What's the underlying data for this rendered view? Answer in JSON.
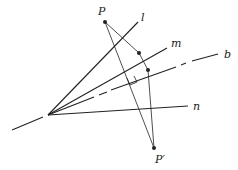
{
  "diagram": {
    "vertex": {
      "x": 48,
      "y": 115
    },
    "lines": [
      {
        "name": "l",
        "label": "l",
        "end": {
          "x": 138,
          "y": 22
        },
        "label_pos": {
          "x": 141,
          "y": 21
        },
        "style": "solid"
      },
      {
        "name": "m",
        "label": "m",
        "end": {
          "x": 167,
          "y": 48
        },
        "label_pos": {
          "x": 171,
          "y": 47
        },
        "style": "solid"
      },
      {
        "name": "b",
        "label": "b",
        "end": {
          "x": 218,
          "y": 54
        },
        "label_pos": {
          "x": 224,
          "y": 58
        },
        "style": "dashed"
      },
      {
        "name": "n",
        "label": "n",
        "end": {
          "x": 188,
          "y": 106
        },
        "label_pos": {
          "x": 193,
          "y": 110
        },
        "style": "solid"
      }
    ],
    "points": [
      {
        "name": "P",
        "label": "P",
        "pos": {
          "x": 105,
          "y": 22
        },
        "label_pos": {
          "x": 98,
          "y": 15
        }
      },
      {
        "name": "P-prime",
        "label": "P′",
        "pos": {
          "x": 154,
          "y": 148
        },
        "label_pos": {
          "x": 155,
          "y": 163
        }
      },
      {
        "name": "foot-on-m",
        "label": "",
        "pos": {
          "x": 139,
          "y": 53
        }
      },
      {
        "name": "foot-on-b",
        "label": "",
        "pos": {
          "x": 148,
          "y": 70
        }
      }
    ],
    "right_angle_marker": {
      "at": {
        "x": 137,
        "y": 79
      }
    }
  }
}
